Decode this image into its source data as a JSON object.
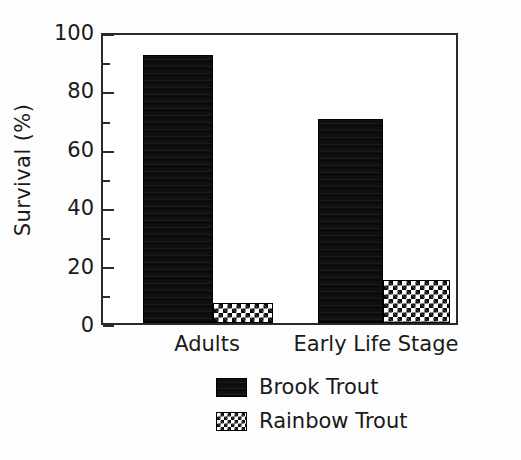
{
  "chart_data": {
    "type": "bar",
    "title": "",
    "subtitle": "",
    "xlabel": "",
    "ylabel": "Survival (%)",
    "categories": [
      "Adults",
      "Early Life Stage"
    ],
    "series": [
      {
        "name": "Brook Trout",
        "values": [
          93,
          71
        ],
        "fill": "solid-black",
        "color": "#0b0b0b"
      },
      {
        "name": "Rainbow Trout",
        "values": [
          7,
          15
        ],
        "fill": "checkerboard",
        "color": "#0b0b0b"
      }
    ],
    "ylim": [
      0,
      100
    ],
    "y_major_ticks": [
      0,
      20,
      40,
      60,
      80,
      100
    ],
    "y_minor_ticks": [
      10,
      30,
      50,
      70,
      90
    ],
    "y_tick_labels": [
      "0",
      "20",
      "40",
      "60",
      "80",
      "100"
    ],
    "grid": false,
    "legend_position": "below-axes-center",
    "frame": "box",
    "background_color": "#ffffff",
    "axis_color": "#2a2a2a"
  },
  "axis": {
    "y_title": "Survival (%)",
    "ticks": [
      {
        "value": 100,
        "label": "100",
        "kind": "major"
      },
      {
        "value": 90,
        "label": "",
        "kind": "minor"
      },
      {
        "value": 80,
        "label": "80",
        "kind": "major"
      },
      {
        "value": 70,
        "label": "",
        "kind": "minor"
      },
      {
        "value": 60,
        "label": "60",
        "kind": "major"
      },
      {
        "value": 50,
        "label": "",
        "kind": "minor"
      },
      {
        "value": 40,
        "label": "40",
        "kind": "major"
      },
      {
        "value": 30,
        "label": "",
        "kind": "minor"
      },
      {
        "value": 20,
        "label": "20",
        "kind": "major"
      },
      {
        "value": 10,
        "label": "",
        "kind": "minor"
      },
      {
        "value": 0,
        "label": "0",
        "kind": "major"
      }
    ]
  },
  "bars": [
    {
      "group": "Adults",
      "series": "Brook Trout",
      "value": 93,
      "fill": "solid"
    },
    {
      "group": "Adults",
      "series": "Rainbow Trout",
      "value": 7,
      "fill": "checker"
    },
    {
      "group": "Early Life Stage",
      "series": "Brook Trout",
      "value": 71,
      "fill": "solid"
    },
    {
      "group": "Early Life Stage",
      "series": "Rainbow Trout",
      "value": 15,
      "fill": "checker"
    }
  ],
  "x_categories": [
    {
      "label": "Adults"
    },
    {
      "label": "Early Life Stage"
    }
  ],
  "legend": {
    "entries": [
      {
        "label": "Brook Trout",
        "fill": "solid"
      },
      {
        "label": "Rainbow Trout",
        "fill": "checker"
      }
    ]
  }
}
